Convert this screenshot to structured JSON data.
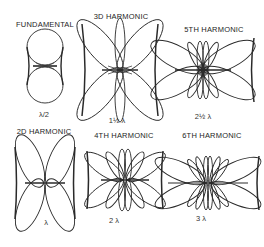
{
  "figure": {
    "colors": {
      "ink": "#2a2a2a",
      "paper": "#ffffff"
    },
    "patterns": [
      {
        "title": "FUNDAMENTAL",
        "length": "λ/2",
        "lobes": 2
      },
      {
        "title": "3D HARMONIC",
        "length": "1½ λ",
        "lobes": 6
      },
      {
        "title": "5TH HARMONIC",
        "length": "2½ λ",
        "lobes": 10
      },
      {
        "title": "2D HARMONIC",
        "length": "λ",
        "lobes": 4
      },
      {
        "title": "4TH HARMONIC",
        "length": "2 λ",
        "lobes": 8
      },
      {
        "title": "6TH HARMONIC",
        "length": "3 λ",
        "lobes": 12
      }
    ]
  }
}
